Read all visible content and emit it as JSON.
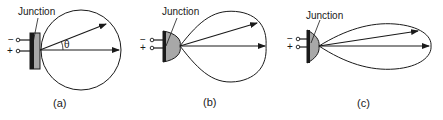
{
  "figure": {
    "panels": [
      {
        "id": "a",
        "caption": "(a)",
        "junction_label": "Junction",
        "angle_label": "θ",
        "terminals": {
          "negative": "−",
          "positive": "+"
        },
        "emitter_shape": "flat",
        "pattern_shape": "circle"
      },
      {
        "id": "b",
        "caption": "(b)",
        "junction_label": "Junction",
        "terminals": {
          "negative": "−",
          "positive": "+"
        },
        "emitter_shape": "hemispherical",
        "pattern_shape": "lobe"
      },
      {
        "id": "c",
        "caption": "(c)",
        "junction_label": "Junction",
        "terminals": {
          "negative": "−",
          "positive": "+"
        },
        "emitter_shape": "parabolic",
        "pattern_shape": "narrow-lobe"
      }
    ],
    "colors": {
      "line": "#1a1a1a",
      "device_fill": "#a8a8a8",
      "background": "#ffffff"
    }
  }
}
